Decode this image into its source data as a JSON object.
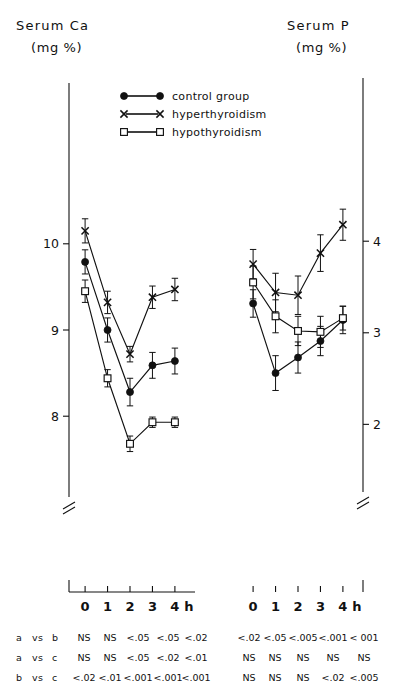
{
  "figure": {
    "left_title_line1": "Serum  Ca",
    "left_title_line2": "(mg %)",
    "right_title_line1": "Serum  P",
    "right_title_line2": "(mg %)",
    "x_unit_suffix": "h"
  },
  "legend": {
    "position": "top-center",
    "items": [
      {
        "label": "control  group",
        "marker": "filled-circle",
        "key": "control"
      },
      {
        "label": "hyperthyroidism",
        "marker": "cross-x",
        "key": "hyper"
      },
      {
        "label": "hypothyroidism",
        "marker": "open-square",
        "key": "hypo"
      }
    ]
  },
  "chart_data": [
    {
      "type": "line",
      "id": "serum-ca",
      "title": "Serum Ca (mg %)",
      "xlabel": "h",
      "ylabel": "Serum Ca (mg %)",
      "x": [
        0,
        1,
        2,
        3,
        4
      ],
      "xticklabels": [
        "0",
        "1",
        "2",
        "3",
        "4"
      ],
      "xlim": [
        -0.45,
        4.45
      ],
      "ylim": [
        7.55,
        10.45
      ],
      "yticks": [
        8,
        9,
        10
      ],
      "yticklabels": [
        "8",
        "9",
        "10"
      ],
      "grid": false,
      "axis_break": true,
      "series": [
        {
          "name": "control group",
          "marker": "filled-circle",
          "values": [
            9.79,
            9.0,
            8.28,
            8.59,
            8.64
          ],
          "errors": [
            0.14,
            0.14,
            0.16,
            0.15,
            0.15
          ]
        },
        {
          "name": "hyperthyroidism",
          "marker": "cross-x",
          "values": [
            10.15,
            9.32,
            8.72,
            9.38,
            9.47
          ],
          "errors": [
            0.14,
            0.13,
            0.09,
            0.13,
            0.13
          ]
        },
        {
          "name": "hypothyroidism",
          "marker": "open-square",
          "values": [
            9.45,
            8.44,
            7.68,
            7.93,
            7.93
          ],
          "errors": [
            0.13,
            0.1,
            0.09,
            0.06,
            0.06
          ]
        }
      ]
    },
    {
      "type": "line",
      "id": "serum-p",
      "title": "Serum P (mg %)",
      "xlabel": "h",
      "ylabel": "Serum P (mg %)",
      "x": [
        0,
        1,
        2,
        3,
        4
      ],
      "xticklabels": [
        "0",
        "1",
        "2",
        "3",
        "4"
      ],
      "xlim": [
        -0.45,
        4.45
      ],
      "ylim": [
        1.72,
        4.45
      ],
      "yticks": [
        2,
        3,
        4
      ],
      "yticklabels": [
        "2",
        "3",
        "4"
      ],
      "grid": false,
      "axis_break": true,
      "series": [
        {
          "name": "control group",
          "marker": "filled-circle",
          "values": [
            3.32,
            2.56,
            2.73,
            2.91,
            3.14
          ],
          "errors": [
            0.15,
            0.19,
            0.17,
            0.16,
            0.15
          ]
        },
        {
          "name": "hyperthyroidism",
          "marker": "cross-x",
          "values": [
            3.75,
            3.44,
            3.41,
            3.87,
            4.18
          ],
          "errors": [
            0.16,
            0.21,
            0.21,
            0.2,
            0.17
          ]
        },
        {
          "name": "hypothyroidism",
          "marker": "open-square",
          "values": [
            3.55,
            3.18,
            3.02,
            3.01,
            3.16
          ],
          "errors": [
            0.18,
            0.18,
            0.16,
            0.17,
            0.13
          ]
        }
      ]
    }
  ],
  "stats": {
    "row_labels": [
      {
        "a": "a",
        "vs": "vs",
        "b": "b"
      },
      {
        "a": "a",
        "vs": "vs",
        "b": "c"
      },
      {
        "a": "b",
        "vs": "vs",
        "b": "c"
      }
    ],
    "left_rows": [
      [
        "NS",
        "NS",
        "<.05",
        "<.05",
        "<.02"
      ],
      [
        "NS",
        "NS",
        "<.05",
        "<.02",
        "<.01"
      ],
      [
        "<.02",
        "<.01",
        "<.001",
        "<.001",
        "<.001"
      ]
    ],
    "right_rows": [
      [
        "<.02",
        "<.05",
        "<.005",
        "<.001",
        "< 001"
      ],
      [
        "NS",
        "NS",
        "NS",
        "NS",
        "NS"
      ],
      [
        "NS",
        "NS",
        "NS",
        "<.02",
        "<.005"
      ]
    ]
  }
}
